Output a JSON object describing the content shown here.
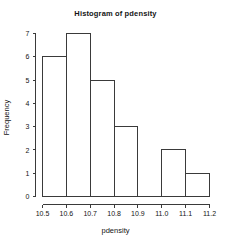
{
  "chart_data": {
    "type": "bar",
    "title": "Histogram of pdensity",
    "xlabel": "pdensity",
    "ylabel": "Frequency",
    "bin_edges": [
      10.5,
      10.6,
      10.7,
      10.8,
      10.9,
      11.0,
      11.1,
      11.2
    ],
    "categories": [
      "10.5-10.6",
      "10.6-10.7",
      "10.7-10.8",
      "10.8-10.9",
      "10.9-11.0",
      "11.0-11.1",
      "11.1-11.2"
    ],
    "values": [
      6,
      7,
      5,
      3,
      0,
      2,
      1
    ],
    "xlim": [
      10.5,
      11.2
    ],
    "ylim": [
      0,
      7
    ],
    "xticks": [
      "10.5",
      "10.6",
      "10.7",
      "10.8",
      "10.9",
      "11.0",
      "11.1",
      "11.2"
    ],
    "xtick_values": [
      10.5,
      10.6,
      10.7,
      10.8,
      10.9,
      11.0,
      11.1,
      11.2
    ],
    "yticks": [
      "0",
      "1",
      "2",
      "3",
      "4",
      "5",
      "6",
      "7"
    ],
    "ytick_values": [
      0,
      1,
      2,
      3,
      4,
      5,
      6,
      7
    ],
    "grid": false,
    "legend": null,
    "bar_fill": "#ffffff",
    "bar_stroke": "#3a3a3a",
    "axis_color": "#3a3a3a",
    "background": "#ffffff"
  }
}
